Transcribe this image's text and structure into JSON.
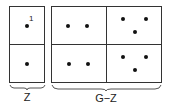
{
  "diagram": {
    "left_group": {
      "label": "Z",
      "cells": [
        {
          "row": 0,
          "col": 0,
          "dots": 1,
          "annotation": "1"
        },
        {
          "row": 1,
          "col": 0,
          "dots": 1
        }
      ]
    },
    "right_group": {
      "label": "G−Z",
      "cells": [
        {
          "row": 0,
          "col": 0,
          "dots": 2
        },
        {
          "row": 0,
          "col": 1,
          "dots": 3
        },
        {
          "row": 1,
          "col": 0,
          "dots": 2
        },
        {
          "row": 1,
          "col": 1,
          "dots": 3
        }
      ]
    },
    "colors": {
      "line": "#333333",
      "dot": "#111111",
      "background": "#ffffff"
    }
  }
}
